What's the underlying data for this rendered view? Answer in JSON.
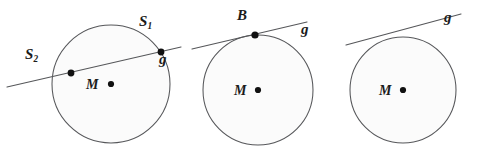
{
  "figure": {
    "kind": "geometry-diagram",
    "background_color": "#ffffff",
    "stroke_color": "#56575a",
    "point_color": "#111111",
    "label_color": "#1b1b1b",
    "circle_fill": "#fbfbfb"
  },
  "panels": [
    {
      "id": "panel-secant",
      "case": "secant",
      "circle": {
        "cx": 111,
        "cy": 84,
        "r": 59
      },
      "center": {
        "dot": {
          "x": 111,
          "y": 84,
          "r": 3.1
        },
        "label": "M",
        "label_x": 86,
        "label_y": 78
      },
      "line": {
        "label": "g",
        "label_x": 159,
        "label_y": 52,
        "x1": 7,
        "y1": 87,
        "x2": 181,
        "y2": 47
      },
      "points": [
        {
          "name": "S2",
          "label_main": "S",
          "label_sub": "2",
          "x": 71,
          "y": 73,
          "r": 3.4,
          "label_x": 25,
          "label_y": 47
        },
        {
          "name": "S1",
          "label_main": "S",
          "label_sub": "1",
          "x": 161,
          "y": 52,
          "r": 3.4,
          "label_x": 139,
          "label_y": 14
        }
      ]
    },
    {
      "id": "panel-tangent",
      "case": "tangent",
      "circle": {
        "cx": 258,
        "cy": 90,
        "r": 55
      },
      "center": {
        "dot": {
          "x": 258,
          "y": 90,
          "r": 3.1
        },
        "label": "M",
        "label_x": 234,
        "label_y": 84
      },
      "line": {
        "label": "g",
        "label_x": 301,
        "label_y": 22,
        "x1": 192,
        "y1": 49,
        "x2": 307,
        "y2": 22
      },
      "points": [
        {
          "name": "B",
          "label_main": "B",
          "label_sub": "",
          "x": 255,
          "y": 35,
          "r": 3.6,
          "label_x": 237,
          "label_y": 8
        }
      ]
    },
    {
      "id": "panel-passant",
      "case": "passant",
      "circle": {
        "cx": 403,
        "cy": 90,
        "r": 53
      },
      "center": {
        "dot": {
          "x": 403,
          "y": 90,
          "r": 3.1
        },
        "label": "M",
        "label_x": 379,
        "label_y": 84
      },
      "line": {
        "label": "g",
        "label_x": 444,
        "label_y": 10,
        "x1": 346,
        "y1": 45,
        "x2": 461,
        "y2": 14
      },
      "points": []
    }
  ]
}
